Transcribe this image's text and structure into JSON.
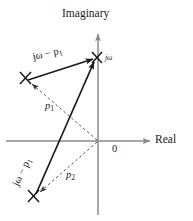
{
  "figure": {
    "axes": {
      "imaginary_label": "Imaginary",
      "real_label": "Real",
      "origin_label": "0"
    },
    "point": {
      "name": "jw-point",
      "label": "jω"
    },
    "poles": [
      {
        "id": "p1",
        "label": "p",
        "subscript": "1"
      },
      {
        "id": "p2",
        "label": "p",
        "subscript": "2"
      }
    ],
    "vectors": [
      {
        "id": "vec-p1-to-jw",
        "label": "jω − p",
        "subscript": "1"
      },
      {
        "id": "vec-p2-to-jw",
        "label": "jω − p",
        "subscript": "1"
      }
    ],
    "colors": {
      "axis": "#8a8a8a",
      "vector": "#1a1a1a",
      "dashed": "#6e6e6e",
      "text": "#1a1a1a",
      "background": "#ffffff"
    }
  }
}
